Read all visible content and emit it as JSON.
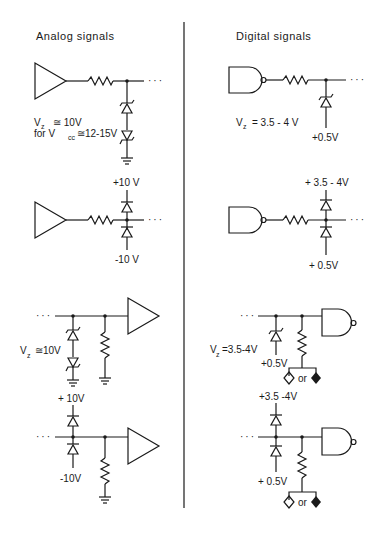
{
  "headers": {
    "analog": "Analog  signals",
    "digital": "Digital  signals"
  },
  "analog": {
    "circuit1": {
      "vz_label": "V",
      "vz_sub": "z",
      "vz_value": "≅ 10V",
      "for_label": "for  V",
      "vcc_sub": "cc",
      "vcc_value": "≅12-15V"
    },
    "circuit2": {
      "top_voltage": "+10 V",
      "bottom_voltage": "-10 V"
    },
    "circuit3": {
      "vz_label": "V",
      "vz_sub": "z",
      "vz_value": "≅10V"
    },
    "circuit4": {
      "top_voltage": "+ 10V",
      "bottom_voltage": "-10V"
    }
  },
  "digital": {
    "circuit1": {
      "vz_label": "V",
      "vz_sub": "z",
      "vz_value": "= 3.5 - 4 V",
      "bottom_voltage": "+0.5V"
    },
    "circuit2": {
      "top_voltage": "+ 3.5 - 4V",
      "bottom_voltage": "+ 0.5V"
    },
    "circuit3": {
      "vz_label": "V",
      "vz_sub": "z",
      "vz_value": "=3.5-4V",
      "bottom_voltage": "+0.5V",
      "or_label": "or"
    },
    "circuit4": {
      "top_voltage": "+3.5 -4V",
      "bottom_voltage": "+ 0.5V",
      "or_label": "or"
    }
  },
  "continuation": "···"
}
